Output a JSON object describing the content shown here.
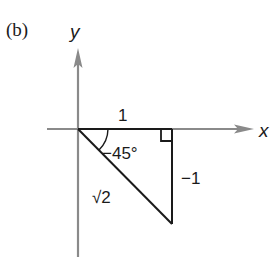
{
  "figure": {
    "panel_label": "(b)",
    "axes": {
      "x_label": "x",
      "y_label": "y",
      "axis_color": "#888888"
    },
    "triangle": {
      "line_color": "#1a1a1a",
      "adjacent_label": "1",
      "opposite_label": "−1",
      "hypotenuse_label": "√2",
      "angle_label": "−45°",
      "right_angle_marker": true
    }
  }
}
